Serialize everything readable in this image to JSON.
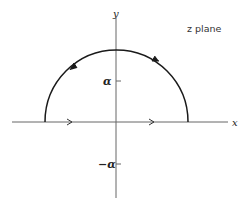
{
  "diagram": {
    "title": "z plane",
    "axes": {
      "x_label": "x",
      "y_label": "y"
    },
    "ticks": {
      "positive": "α",
      "negative": "−α"
    },
    "contour": {
      "shape": "semicircle (upper half-plane) closed along real axis",
      "orientation": "counterclockwise",
      "segments": [
        {
          "name": "real-axis-segment",
          "direction": "left to right"
        },
        {
          "name": "upper-arc",
          "direction": "right to left (counterclockwise)"
        }
      ]
    },
    "colors": {
      "stroke": "#1a1a1a",
      "axis": "#555555",
      "background": "#ffffff"
    }
  }
}
